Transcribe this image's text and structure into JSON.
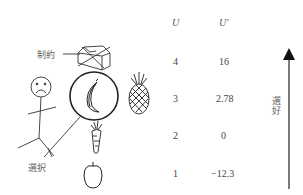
{
  "labels": {
    "constraint": "制約",
    "choice": "選択",
    "preference": "選好"
  },
  "table": {
    "headers": [
      "U",
      "U′"
    ],
    "rows": [
      {
        "u": "4",
        "u_prime": "16"
      },
      {
        "u": "3",
        "u_prime": "2.78"
      },
      {
        "u": "2",
        "u_prime": "0"
      },
      {
        "u": "1",
        "u_prime": "−12.3"
      }
    ]
  },
  "items": [
    {
      "name": "box",
      "rank": 4,
      "note": "crossed out (constraint)"
    },
    {
      "name": "banana",
      "rank": 3,
      "note": "circled (chosen)"
    },
    {
      "name": "pineapple",
      "rank": 3
    },
    {
      "name": "carrot",
      "rank": 2
    },
    {
      "name": "apple",
      "rank": 1
    }
  ],
  "colors": {
    "line": "#333333",
    "text": "#555555",
    "arrow": "#222222"
  }
}
